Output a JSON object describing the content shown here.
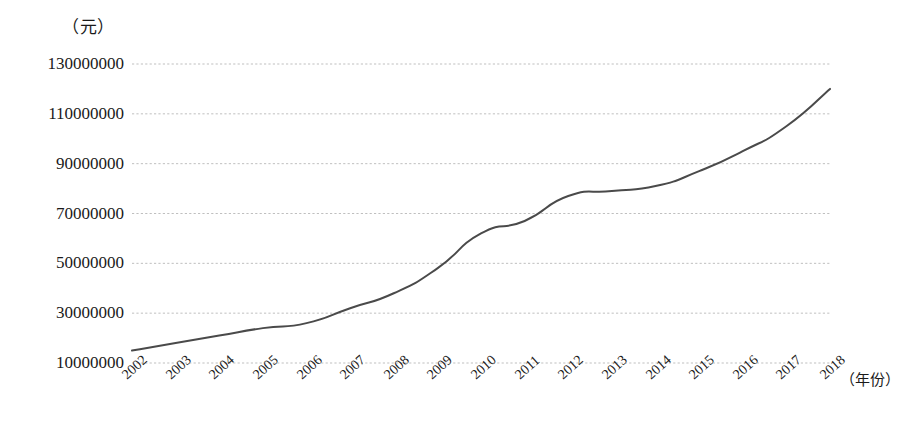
{
  "chart_data": {
    "type": "line",
    "title": "",
    "subtitle": "",
    "ylabel": "（元）",
    "xlabel": "（年份）",
    "x": [
      2002,
      2003,
      2004,
      2005,
      2006,
      2007,
      2008,
      2009,
      2010,
      2011,
      2012,
      2013,
      2014,
      2015,
      2016,
      2017,
      2018
    ],
    "categories": [
      "2002",
      "2003",
      "2004",
      "2005",
      "2006",
      "2007",
      "2008",
      "2009",
      "2010",
      "2011",
      "2012",
      "2013",
      "2014",
      "2015",
      "2016",
      "2017",
      "2018"
    ],
    "values": [
      15000000,
      18000000,
      21000000,
      24000000,
      26000000,
      32000000,
      38000000,
      48000000,
      62000000,
      67000000,
      77000000,
      79000000,
      81000000,
      87000000,
      95000000,
      105000000,
      120000000
    ],
    "series": [
      {
        "name": "",
        "values": [
          15000000,
          18000000,
          21000000,
          24000000,
          26000000,
          32000000,
          38000000,
          48000000,
          62000000,
          67000000,
          77000000,
          79000000,
          81000000,
          87000000,
          95000000,
          105000000,
          120000000
        ],
        "color": "#4a4a4a"
      }
    ],
    "ytick_labels": [
      "10000000",
      "30000000",
      "50000000",
      "70000000",
      "90000000",
      "110000000",
      "130000000"
    ],
    "ytick_values": [
      10000000,
      30000000,
      50000000,
      70000000,
      90000000,
      110000000,
      130000000
    ],
    "ylim": [
      10000000,
      130000000
    ],
    "xlim": [
      2002,
      2018
    ],
    "grid": "horizontal-dotted",
    "grid_color": "#bfbfbf",
    "legend": "none",
    "line_color": "#4a4a4a",
    "line_width": 2,
    "markers": "none",
    "background": "#ffffff",
    "xtick_rotation": -42
  }
}
